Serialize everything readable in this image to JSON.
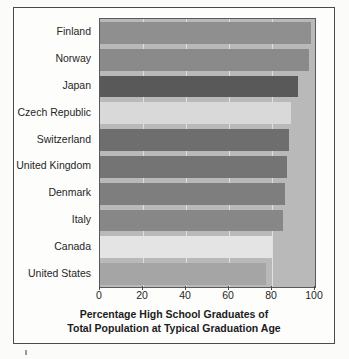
{
  "chart_data": {
    "type": "bar",
    "orientation": "horizontal",
    "title": "",
    "xlabel": "Percentage High School Graduates of Total Population at Typical Graduation Age",
    "ylabel": "",
    "xlim": [
      0,
      100
    ],
    "xticks": [
      0,
      20,
      40,
      60,
      80,
      100
    ],
    "grid": true,
    "legend": false,
    "categories": [
      "Finland",
      "Norway",
      "Japan",
      "Czech Republic",
      "Switzerland",
      "United Kingdom",
      "Denmark",
      "Italy",
      "Canada",
      "United States"
    ],
    "values": [
      98,
      97,
      92,
      89,
      88,
      87,
      86,
      85,
      80,
      77
    ],
    "bar_colors": [
      "#8f8f8f",
      "#8a8a8a",
      "#595959",
      "#d9d9d9",
      "#6e6e6e",
      "#747474",
      "#7e7e7e",
      "#878787",
      "#e4e4e4",
      "#a5a5a5"
    ],
    "plot_background": "#b9b9b9"
  },
  "axis": {
    "title_line1": "Percentage High School Graduates of",
    "title_line2": "Total Population at Typical Graduation Age",
    "tick_labels": [
      "0",
      "20",
      "40",
      "60",
      "80",
      "100"
    ]
  },
  "colors": {
    "frame_border": "#4b4b4b",
    "page_background": "#fbfbfa",
    "axis_text": "#262626"
  }
}
